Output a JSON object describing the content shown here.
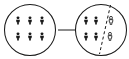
{
  "figure": {
    "title": "",
    "background_color": "#ffffff",
    "stroke_color": "#1a1a1a",
    "width": 129,
    "height": 59
  },
  "groups": [
    {
      "id": "source-group",
      "label": "",
      "shape": "circle",
      "center": {
        "x": 30,
        "y": 30
      },
      "radius": 25.5,
      "people": {
        "style": "solid",
        "count": 6,
        "rows": 2,
        "columns": 3,
        "positions": [
          {
            "x": 18,
            "y": 21
          },
          {
            "x": 30,
            "y": 21
          },
          {
            "x": 42,
            "y": 21
          },
          {
            "x": 18,
            "y": 37
          },
          {
            "x": 30,
            "y": 37
          },
          {
            "x": 42,
            "y": 37
          }
        ]
      },
      "divider": null
    },
    {
      "id": "result-group",
      "label": "",
      "shape": "circle",
      "center": {
        "x": 101,
        "y": 30
      },
      "radius": 25.5,
      "people": {
        "style": "mixed",
        "count": 6,
        "solid_count": 4,
        "hollow_count": 2,
        "positions": [
          {
            "x": 86,
            "y": 21,
            "style": "solid"
          },
          {
            "x": 96,
            "y": 21,
            "style": "solid"
          },
          {
            "x": 86,
            "y": 37,
            "style": "solid"
          },
          {
            "x": 96,
            "y": 37,
            "style": "solid"
          },
          {
            "x": 111,
            "y": 21,
            "style": "hollow"
          },
          {
            "x": 110,
            "y": 37,
            "style": "hollow"
          }
        ]
      },
      "divider": {
        "style": "dashed",
        "x1": 110.5,
        "y1": 5.0,
        "x2": 99.5,
        "y2": 54.0
      }
    }
  ],
  "connector": {
    "id": "transition-arrow",
    "type": "arrow",
    "direction": "right",
    "label": "",
    "x1": 58,
    "y1": 30,
    "x2": 79,
    "y2": 30
  },
  "icons": {
    "person": "person-icon",
    "arrow": "arrow-right-icon",
    "divider": "dashed-divider-icon",
    "circle": "circle-boundary-icon"
  }
}
